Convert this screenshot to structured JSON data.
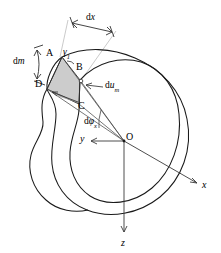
{
  "figure": {
    "kind": "mechanics-diagram",
    "background_color": "#ffffff",
    "line_color": "#000000",
    "leader_color": "#b4b4b4",
    "shade_fill": "#c8c8c8",
    "shade_fill_dark": "#a9a9a9"
  },
  "labels": {
    "dx": "dx",
    "dm": "dm",
    "gamma1_base": "γ",
    "gamma1_sub": "1",
    "point_a": "A",
    "point_b": "B",
    "point_c": "C",
    "point_d": "D",
    "origin": "O",
    "du_base": "du",
    "du_sub": "m",
    "dphi_base": "dφ",
    "dphi_sub": "x",
    "axis_x": "x",
    "axis_y": "y",
    "axis_z": "z"
  },
  "geometry": {
    "origin_point": [
      124,
      141
    ],
    "axis_x_tip": [
      199,
      184
    ],
    "axis_y_tip": [
      89,
      141
    ],
    "axis_z_tip": [
      124,
      233
    ],
    "quad_a": [
      62,
      57
    ],
    "quad_b": [
      80,
      80
    ],
    "quad_c": [
      79,
      104
    ],
    "quad_d": [
      47,
      89
    ],
    "dx_arrow_start": [
      71,
      22
    ],
    "dx_arrow_end": [
      113,
      32
    ],
    "dm_bracket_x": 37,
    "dm_bracket_top": 50,
    "dm_bracket_bottom": 79
  }
}
